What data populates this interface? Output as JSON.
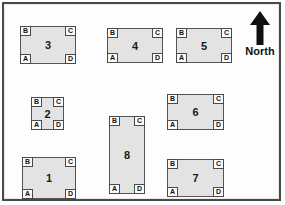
{
  "figure": {
    "type": "site-plot-map",
    "background_color": "#fdfdfd",
    "border_color": "#4a4a4a",
    "plot_fill_color": "#e3e3e3",
    "plot_border_color": "#555555",
    "corner_labels": [
      "A",
      "B",
      "C",
      "D"
    ],
    "corner_label_positions": {
      "A": "bottom-left",
      "B": "top-left",
      "C": "top-right",
      "D": "bottom-right"
    }
  },
  "compass": {
    "label": "North",
    "icon": "up-arrow-icon",
    "direction": "up"
  },
  "plots": [
    {
      "id": "plot-3",
      "label": "3",
      "x": 16,
      "y": 22,
      "width": 56,
      "height": 38,
      "corners": {
        "tl": "B",
        "tr": "C",
        "bl": "A",
        "br": "D"
      }
    },
    {
      "id": "plot-4",
      "label": "4",
      "x": 103,
      "y": 24,
      "width": 56,
      "height": 35,
      "corners": {
        "tl": "B",
        "tr": "C",
        "bl": "A",
        "br": "D"
      }
    },
    {
      "id": "plot-5",
      "label": "5",
      "x": 172,
      "y": 24,
      "width": 56,
      "height": 35,
      "corners": {
        "tl": "B",
        "tr": "C",
        "bl": "A",
        "br": "D"
      }
    },
    {
      "id": "plot-2",
      "label": "2",
      "x": 27,
      "y": 93,
      "width": 33,
      "height": 33,
      "corners": {
        "tl": "B",
        "tr": "C",
        "bl": "A",
        "br": "D"
      }
    },
    {
      "id": "plot-6",
      "label": "6",
      "x": 163,
      "y": 90,
      "width": 57,
      "height": 36,
      "corners": {
        "tl": "B",
        "tr": "C",
        "bl": "A",
        "br": "D"
      }
    },
    {
      "id": "plot-8",
      "label": "8",
      "x": 105,
      "y": 112,
      "width": 36,
      "height": 78,
      "corners": {
        "tl": "B",
        "tr": "C",
        "bl": "A",
        "br": "D"
      }
    },
    {
      "id": "plot-1",
      "label": "1",
      "x": 18,
      "y": 153,
      "width": 54,
      "height": 42,
      "corners": {
        "tl": "B",
        "tr": "C",
        "bl": "A",
        "br": "D"
      }
    },
    {
      "id": "plot-7",
      "label": "7",
      "x": 163,
      "y": 155,
      "width": 57,
      "height": 38,
      "corners": {
        "tl": "B",
        "tr": "C",
        "bl": "A",
        "br": "D"
      }
    }
  ]
}
